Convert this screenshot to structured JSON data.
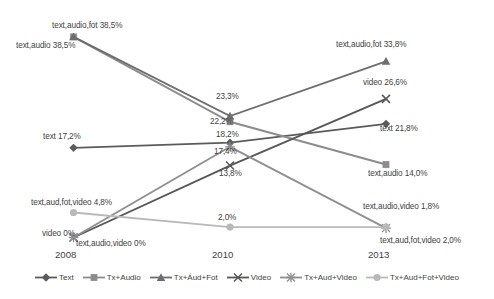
{
  "chart_data": {
    "type": "line",
    "title": "",
    "xlabel": "",
    "ylabel": "",
    "categories": [
      "2008",
      "2010",
      "2013"
    ],
    "grid": false,
    "legend_position": "bottom",
    "ylim": [
      0,
      40
    ],
    "series": [
      {
        "name": "Text",
        "marker": "diamond",
        "color": "#5b5b5b",
        "values": [
          17.2,
          18.2,
          21.8
        ],
        "value_labels": [
          "17,2%",
          "18,2%",
          "21,8%"
        ]
      },
      {
        "name": "Tx+Audio",
        "marker": "square",
        "color": "#8c8c8c",
        "values": [
          38.5,
          22.2,
          14.0
        ],
        "value_labels": [
          "38,5%",
          "22,2%",
          "14,0%"
        ]
      },
      {
        "name": "Tx+Áud+Fot",
        "marker": "triangle",
        "color": "#6d6d6d",
        "values": [
          38.5,
          23.3,
          33.8
        ],
        "value_labels": [
          "38,5%",
          "23,3%",
          "33,8%"
        ]
      },
      {
        "name": "Video",
        "marker": "x",
        "color": "#575757",
        "values": [
          0.0,
          13.8,
          26.6
        ],
        "value_labels": [
          "0%",
          "13,8%",
          "26,6%"
        ]
      },
      {
        "name": "Tx+Aud+Video",
        "marker": "star",
        "color": "#8f8f8f",
        "values": [
          0.0,
          17.4,
          1.8
        ],
        "value_labels": [
          "0%",
          "17,4%",
          "1,8%"
        ]
      },
      {
        "name": "Tx+Aud+Fot+Video",
        "marker": "circle",
        "color": "#b9b9b9",
        "values": [
          4.8,
          2.0,
          2.0
        ],
        "value_labels": [
          "4,8%",
          "2,0%",
          "2,0%"
        ]
      }
    ],
    "point_labels": [
      {
        "text": "text,audio,fot 38,5%",
        "x": 52,
        "y": 22
      },
      {
        "text": "text,audio 38,5%",
        "x": 16,
        "y": 42
      },
      {
        "text": "text 17,2%",
        "x": 43,
        "y": 133
      },
      {
        "text": "text,aud,fot,video 4,8%",
        "x": 31,
        "y": 199
      },
      {
        "text": "video 0%",
        "x": 42,
        "y": 230
      },
      {
        "text": "text,audio,video 0%",
        "x": 76,
        "y": 240
      },
      {
        "text": "23,3%",
        "x": 216,
        "y": 93
      },
      {
        "text": "22,2%",
        "x": 210,
        "y": 118
      },
      {
        "text": "18,2%",
        "x": 216,
        "y": 131
      },
      {
        "text": "17,4%",
        "x": 214,
        "y": 148
      },
      {
        "text": "13,8%",
        "x": 219,
        "y": 170
      },
      {
        "text": "2,0%",
        "x": 218,
        "y": 214
      },
      {
        "text": "text,audio,fot 33,8%",
        "x": 336,
        "y": 41
      },
      {
        "text": "video 26,6%",
        "x": 363,
        "y": 79
      },
      {
        "text": "text 21,8%",
        "x": 380,
        "y": 125
      },
      {
        "text": "text,audio 14,0%",
        "x": 368,
        "y": 170
      },
      {
        "text": "text,audio,video 1,8%",
        "x": 363,
        "y": 203
      },
      {
        "text": "text,aud,fot,video  2,0%",
        "x": 380,
        "y": 237
      }
    ],
    "tick_labels": [
      {
        "text": "2008",
        "x": 55,
        "y": 250
      },
      {
        "text": "2010",
        "x": 212,
        "y": 250
      },
      {
        "text": "2013",
        "x": 368,
        "y": 250
      }
    ]
  }
}
